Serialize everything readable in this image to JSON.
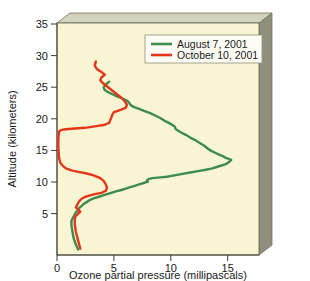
{
  "chart_data": {
    "type": "line",
    "title": "",
    "xlabel": "Ozone partial pressure (millipascals)",
    "ylabel": "Altitude (kilometers)",
    "orientation": "x = ozone partial pressure, y = altitude",
    "xlim": [
      0,
      18.2
    ],
    "ylim": [
      2.2,
      35.4
    ],
    "xticks": [
      0,
      5,
      10,
      15
    ],
    "xticklabels": [
      "0",
      "5",
      "10",
      "15"
    ],
    "yticks": [
      5,
      10,
      15,
      20,
      25,
      30,
      35
    ],
    "yticklabels": [
      "5",
      "10",
      "15",
      "20",
      "25",
      "30",
      "35"
    ],
    "grid": false,
    "legend_position": "top-right",
    "plot_background": "#f9f5d2",
    "series": [
      {
        "name": "August 7, 2001",
        "color": "#3d8b4f",
        "x": [
          4.7,
          4.4,
          4.2,
          4.3,
          4.6,
          5.0,
          5.4,
          5.9,
          6.3,
          6.5,
          6.6,
          6.9,
          7.4,
          7.9,
          8.4,
          8.8,
          9.3,
          9.7,
          10.2,
          10.6,
          10.7,
          11.1,
          11.6,
          12.0,
          12.5,
          12.9,
          13.3,
          13.6,
          13.9,
          14.3,
          14.7,
          15.0,
          15.2,
          15.4,
          15.6,
          15.7,
          15.5,
          15.2,
          14.6,
          14.0,
          13.4,
          12.7,
          12.0,
          11.3,
          10.6,
          9.9,
          9.3,
          8.6,
          8.3,
          8.1,
          8.2,
          7.8,
          7.4,
          7.0,
          6.6,
          6.2,
          5.8,
          5.3,
          4.9,
          4.5,
          4.1,
          3.7,
          3.3,
          3.0,
          2.7,
          2.4,
          2.2,
          2.0,
          1.9,
          1.7,
          1.6,
          1.5,
          1.4,
          1.3,
          1.3,
          1.4,
          1.5,
          1.7,
          1.9
        ],
        "y": [
          27.0,
          26.6,
          26.2,
          25.8,
          25.5,
          25.2,
          24.9,
          24.6,
          24.3,
          24.0,
          23.7,
          23.4,
          23.1,
          22.8,
          22.5,
          22.2,
          21.8,
          21.4,
          21.0,
          20.6,
          20.2,
          19.8,
          19.4,
          19.0,
          18.6,
          18.2,
          17.8,
          17.4,
          17.1,
          16.8,
          16.5,
          16.3,
          16.1,
          16.0,
          15.9,
          15.8,
          15.5,
          15.2,
          14.9,
          14.6,
          14.4,
          14.2,
          14.0,
          13.8,
          13.6,
          13.4,
          13.3,
          13.2,
          13.1,
          12.9,
          12.7,
          12.5,
          12.3,
          12.1,
          11.9,
          11.7,
          11.5,
          11.3,
          11.1,
          10.9,
          10.7,
          10.5,
          10.3,
          10.1,
          9.8,
          9.5,
          9.2,
          8.9,
          8.6,
          8.3,
          8.0,
          7.7,
          7.4,
          7.1,
          6.5,
          5.5,
          4.6,
          3.7,
          3.0
        ],
        "peak_value": 15.7,
        "peak_altitude": 15.8
      },
      {
        "name": "October 10, 2001",
        "color": "#e4361c",
        "x": [
          3.5,
          3.4,
          3.6,
          4.0,
          4.3,
          4.0,
          3.9,
          4.2,
          4.6,
          5.0,
          5.4,
          5.8,
          6.1,
          6.3,
          6.2,
          5.8,
          5.4,
          5.1,
          5.0,
          4.9,
          4.8,
          4.7,
          4.2,
          3.4,
          2.5,
          1.6,
          0.8,
          0.4,
          0.2,
          0.15,
          0.12,
          0.12,
          0.15,
          0.2,
          0.3,
          0.5,
          0.8,
          1.3,
          1.9,
          2.6,
          3.3,
          3.9,
          4.2,
          4.4,
          4.5,
          4.4,
          4.0,
          3.4,
          2.9,
          2.5,
          2.2,
          2.0,
          1.9,
          1.8,
          1.7,
          1.9,
          2.1,
          1.9,
          1.7,
          1.6,
          1.6,
          1.7,
          1.9,
          2.1
        ],
        "y": [
          29.9,
          29.3,
          28.8,
          28.4,
          28.0,
          27.6,
          27.2,
          26.7,
          26.2,
          25.7,
          25.2,
          24.7,
          24.2,
          23.7,
          23.3,
          23.0,
          22.8,
          22.6,
          22.3,
          21.9,
          21.5,
          21.1,
          20.8,
          20.6,
          20.4,
          20.3,
          20.2,
          20.1,
          19.9,
          19.4,
          18.6,
          17.7,
          16.8,
          16.0,
          15.4,
          15.0,
          14.6,
          14.3,
          14.1,
          13.9,
          13.6,
          13.2,
          12.8,
          12.3,
          11.8,
          11.4,
          11.1,
          10.9,
          10.7,
          10.5,
          10.2,
          9.9,
          9.6,
          9.3,
          9.0,
          8.7,
          8.4,
          8.1,
          7.8,
          7.4,
          6.6,
          5.5,
          4.3,
          3.1
        ],
        "peak_value": 6.3,
        "peak_altitude": 23.7,
        "minimum_value": 0.12,
        "minimum_altitude_range": [
          17.0,
          19.0
        ]
      }
    ],
    "legend": [
      {
        "label": "August 7, 2001",
        "color": "#3d8b4f"
      },
      {
        "label": "October 10, 2001",
        "color": "#e4361c"
      }
    ]
  },
  "colors": {
    "plot_background": "#f9f5d2",
    "box_side": "#8f8f7c",
    "box_top": "#c9c8b4",
    "frame": "#6e6e5c",
    "text": "#1a1a1a",
    "legend_background": "#fdfdf5",
    "legend_border": "#9a9a88"
  }
}
